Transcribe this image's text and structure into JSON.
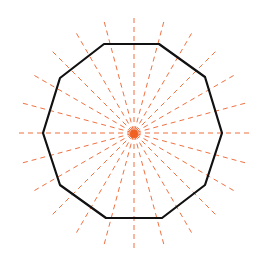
{
  "diagram": {
    "shape": "regular dodecagon",
    "sides": 12,
    "lines_of_symmetry": 12,
    "center": [
      133,
      133
    ],
    "vertices": [
      [
        104,
        44
      ],
      [
        159,
        44
      ],
      [
        205,
        77
      ],
      [
        222,
        133
      ],
      [
        205,
        185
      ],
      [
        162,
        218
      ],
      [
        106,
        218
      ],
      [
        60,
        185
      ],
      [
        43,
        133
      ],
      [
        60,
        78
      ]
    ],
    "colors": {
      "outline": "#111111",
      "symmetry_lines": "#f07040",
      "background": "#ffffff"
    }
  }
}
